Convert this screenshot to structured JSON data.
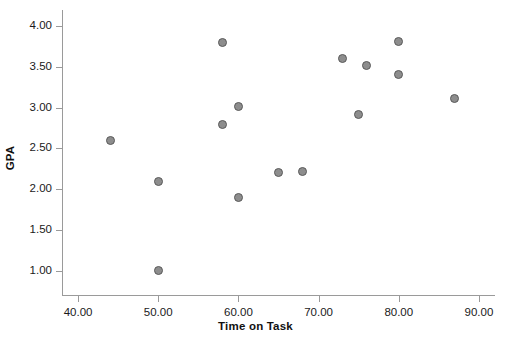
{
  "chart_data": {
    "type": "scatter",
    "title": "",
    "xlabel": "Time on Task",
    "ylabel": "GPA",
    "xlim": [
      38.0,
      92.0
    ],
    "ylim": [
      0.7,
      4.2
    ],
    "xticks": [
      "40.00",
      "50.00",
      "60.00",
      "70.00",
      "80.00",
      "90.00"
    ],
    "xtick_values": [
      40.0,
      50.0,
      60.0,
      70.0,
      80.0,
      90.0
    ],
    "yticks": [
      "1.00",
      "1.50",
      "2.00",
      "2.50",
      "3.00",
      "3.50",
      "4.00"
    ],
    "ytick_values": [
      1.0,
      1.5,
      2.0,
      2.5,
      3.0,
      3.5,
      4.0
    ],
    "grid": false,
    "legend": false,
    "marker_fill": "#8d8d8d",
    "marker_edge": "#5a5a5a",
    "axis_color": "#9a9a9a",
    "points": [
      {
        "x": 44.0,
        "y": 2.6
      },
      {
        "x": 50.0,
        "y": 2.1
      },
      {
        "x": 50.0,
        "y": 1.0
      },
      {
        "x": 58.0,
        "y": 3.8
      },
      {
        "x": 58.0,
        "y": 2.8
      },
      {
        "x": 60.0,
        "y": 3.01
      },
      {
        "x": 60.0,
        "y": 1.9
      },
      {
        "x": 65.0,
        "y": 2.21
      },
      {
        "x": 68.0,
        "y": 2.22
      },
      {
        "x": 73.0,
        "y": 3.61
      },
      {
        "x": 75.0,
        "y": 2.92
      },
      {
        "x": 76.0,
        "y": 3.52
      },
      {
        "x": 80.0,
        "y": 3.81
      },
      {
        "x": 80.0,
        "y": 3.41
      },
      {
        "x": 87.0,
        "y": 3.11
      }
    ]
  }
}
